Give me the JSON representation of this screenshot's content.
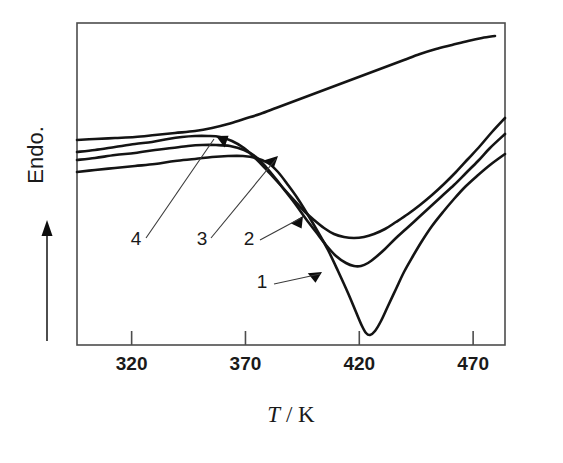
{
  "figure": {
    "kind": "dsc-thermogram",
    "background_color": "#ffffff",
    "line_color": "#141414",
    "frame_color": "#4d4d4d"
  },
  "chart_data": {
    "type": "line",
    "title": "",
    "subtitle": "",
    "xlabel": "T / K",
    "xlabel_parts": {
      "symbol": "T",
      "separator": " / ",
      "unit": "K"
    },
    "ylabel": "Endo.",
    "ylabel_direction_arrow": "up",
    "grid": false,
    "legend": "none",
    "xlim": [
      296,
      484
    ],
    "xticks": [
      320,
      370,
      420,
      470
    ],
    "xtick_labels": [
      "320",
      "370",
      "420",
      "470"
    ],
    "ylim": [
      0,
      100
    ],
    "yticks": [],
    "ytick_labels": [],
    "y_axis_note": "arbitrary units; heat flow, endothermic up",
    "annotations": [
      {
        "label": "1",
        "target_curve": "1",
        "x": 262,
        "y": 288
      },
      {
        "label": "2",
        "target_curve": "2",
        "x": 249,
        "y": 245
      },
      {
        "label": "3",
        "target_curve": "3",
        "x": 202,
        "y": 245
      },
      {
        "label": "4",
        "target_curve": "4",
        "x": 136,
        "y": 245
      }
    ],
    "series": [
      {
        "name": "1",
        "label": "1",
        "minimum_T": 421,
        "points_px": [
          [
            77,
            172
          ],
          [
            95,
            170
          ],
          [
            115,
            168
          ],
          [
            135,
            166
          ],
          [
            155,
            164
          ],
          [
            175,
            161
          ],
          [
            195,
            159
          ],
          [
            212,
            157
          ],
          [
            228,
            156
          ],
          [
            243,
            156
          ],
          [
            256,
            158
          ],
          [
            268,
            163
          ],
          [
            278,
            172
          ],
          [
            288,
            185
          ],
          [
            298,
            199
          ],
          [
            308,
            215
          ],
          [
            318,
            232
          ],
          [
            328,
            250
          ],
          [
            338,
            271
          ],
          [
            348,
            293
          ],
          [
            356,
            312
          ],
          [
            362,
            326
          ],
          [
            366,
            333
          ],
          [
            370,
            335
          ],
          [
            375,
            331
          ],
          [
            381,
            321
          ],
          [
            388,
            306
          ],
          [
            396,
            289
          ],
          [
            404,
            272
          ],
          [
            413,
            256
          ],
          [
            422,
            241
          ],
          [
            432,
            226
          ],
          [
            443,
            212
          ],
          [
            454,
            199
          ],
          [
            465,
            187
          ],
          [
            477,
            176
          ],
          [
            490,
            165
          ],
          [
            505,
            154
          ]
        ]
      },
      {
        "name": "2",
        "label": "2",
        "minimum_T": 420,
        "points_px": [
          [
            77,
            160
          ],
          [
            95,
            158
          ],
          [
            115,
            155
          ],
          [
            135,
            153
          ],
          [
            155,
            150
          ],
          [
            172,
            148
          ],
          [
            188,
            146
          ],
          [
            202,
            145
          ],
          [
            216,
            145
          ],
          [
            230,
            146
          ],
          [
            244,
            150
          ],
          [
            256,
            157
          ],
          [
            266,
            167
          ],
          [
            276,
            179
          ],
          [
            286,
            192
          ],
          [
            296,
            205
          ],
          [
            306,
            219
          ],
          [
            316,
            232
          ],
          [
            326,
            245
          ],
          [
            336,
            256
          ],
          [
            346,
            263
          ],
          [
            354,
            266
          ],
          [
            361,
            266
          ],
          [
            368,
            263
          ],
          [
            376,
            257
          ],
          [
            385,
            249
          ],
          [
            395,
            239
          ],
          [
            406,
            229
          ],
          [
            418,
            218
          ],
          [
            430,
            207
          ],
          [
            442,
            196
          ],
          [
            454,
            185
          ],
          [
            466,
            173
          ],
          [
            478,
            161
          ],
          [
            490,
            148
          ],
          [
            505,
            134
          ]
        ]
      },
      {
        "name": "3",
        "label": "3",
        "minimum_T": 421,
        "points_px": [
          [
            77,
            152
          ],
          [
            95,
            150
          ],
          [
            115,
            147
          ],
          [
            135,
            144
          ],
          [
            152,
            142
          ],
          [
            168,
            139
          ],
          [
            182,
            137
          ],
          [
            195,
            136
          ],
          [
            208,
            136
          ],
          [
            220,
            137
          ],
          [
            232,
            141
          ],
          [
            244,
            148
          ],
          [
            254,
            157
          ],
          [
            264,
            167
          ],
          [
            274,
            178
          ],
          [
            284,
            189
          ],
          [
            294,
            200
          ],
          [
            304,
            211
          ],
          [
            314,
            220
          ],
          [
            324,
            228
          ],
          [
            334,
            234
          ],
          [
            344,
            237
          ],
          [
            354,
            238
          ],
          [
            364,
            237
          ],
          [
            374,
            234
          ],
          [
            385,
            229
          ],
          [
            396,
            222
          ],
          [
            408,
            214
          ],
          [
            420,
            205
          ],
          [
            432,
            195
          ],
          [
            444,
            184
          ],
          [
            456,
            172
          ],
          [
            468,
            159
          ],
          [
            480,
            146
          ],
          [
            492,
            132
          ],
          [
            505,
            118
          ]
        ]
      },
      {
        "name": "4",
        "label": "4",
        "minimum_T": null,
        "points_px": [
          [
            77,
            140
          ],
          [
            95,
            139
          ],
          [
            115,
            138
          ],
          [
            135,
            137
          ],
          [
            155,
            135
          ],
          [
            175,
            133
          ],
          [
            195,
            131
          ],
          [
            212,
            128
          ],
          [
            228,
            124
          ],
          [
            244,
            119
          ],
          [
            260,
            114
          ],
          [
            276,
            108
          ],
          [
            292,
            102
          ],
          [
            308,
            96
          ],
          [
            324,
            90
          ],
          [
            340,
            84
          ],
          [
            356,
            78
          ],
          [
            372,
            72
          ],
          [
            388,
            66
          ],
          [
            404,
            60
          ],
          [
            420,
            54
          ],
          [
            436,
            49
          ],
          [
            452,
            45
          ],
          [
            468,
            41
          ],
          [
            482,
            38
          ],
          [
            495,
            36
          ]
        ]
      }
    ],
    "curve_arrow_markers": [
      {
        "curve": "4",
        "x": 216,
        "y": 136,
        "angle": 208
      },
      {
        "curve": "3",
        "x": 278,
        "y": 156,
        "angle": 318
      },
      {
        "curve": "2",
        "x": 303,
        "y": 216,
        "angle": 305
      },
      {
        "curve": "1",
        "x": 322,
        "y": 272,
        "angle": 330
      }
    ]
  },
  "axes": {
    "x_tick_values": [
      "320",
      "370",
      "420",
      "470"
    ],
    "x_title": "T / K",
    "y_title": "Endo."
  }
}
